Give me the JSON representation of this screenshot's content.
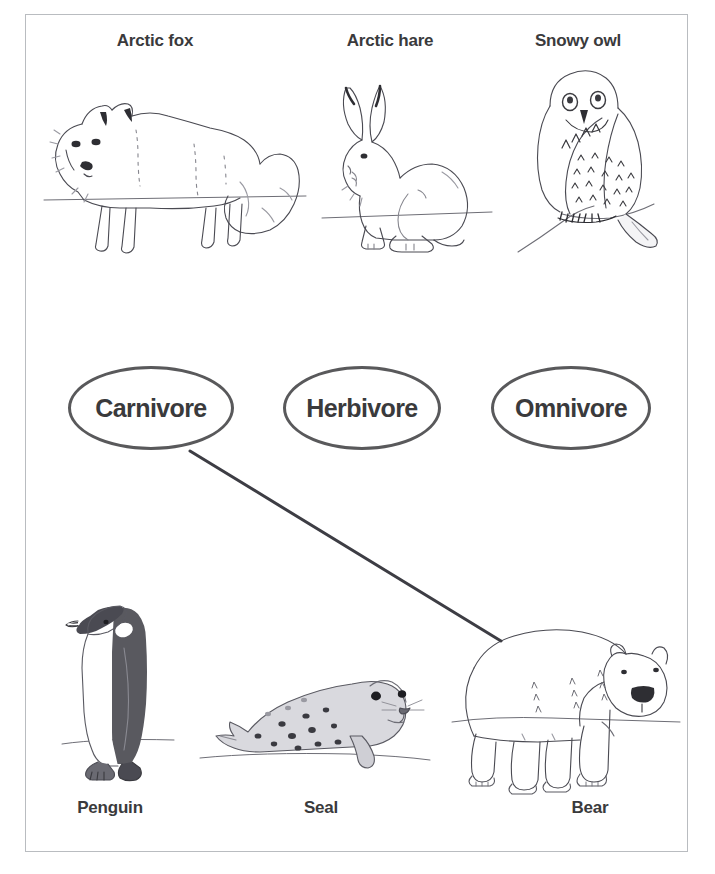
{
  "worksheet": {
    "title": "Arctic animals classification",
    "border_color": "#b9bcc0",
    "background_color": "#ffffff",
    "ink_color": "#3a3a3c",
    "oval_stroke_color": "#59595b",
    "connector_color": "#3d3d44"
  },
  "top_row": {
    "animals": [
      {
        "label": "Arctic fox",
        "icon": "arctic-fox-illustration",
        "center_x": 155,
        "label_y": 31
      },
      {
        "label": "Arctic hare",
        "icon": "arctic-hare-illustration",
        "center_x": 390,
        "label_y": 31
      },
      {
        "label": "Snowy owl",
        "icon": "snowy-owl-illustration",
        "center_x": 578,
        "label_y": 31
      }
    ]
  },
  "categories": {
    "ovals": [
      {
        "label": "Carnivore",
        "left": 68,
        "top": 366,
        "width": 166,
        "height": 84
      },
      {
        "label": "Herbivore",
        "left": 283,
        "top": 366,
        "width": 158,
        "height": 84
      },
      {
        "label": "Omnivore",
        "left": 491,
        "top": 366,
        "width": 160,
        "height": 84
      }
    ]
  },
  "bottom_row": {
    "animals": [
      {
        "label": "Penguin",
        "icon": "penguin-illustration",
        "center_x": 110,
        "label_y": 798
      },
      {
        "label": "Seal",
        "icon": "seal-illustration",
        "center_x": 321,
        "label_y": 798
      },
      {
        "label": "Bear",
        "icon": "bear-illustration",
        "center_x": 590,
        "label_y": 798
      }
    ]
  },
  "connections": [
    {
      "name": "carnivore-to-bear",
      "from": "Carnivore",
      "to": "Bear",
      "x1": 190,
      "y1": 451,
      "x2": 501,
      "y2": 641,
      "stroke_width": 3
    }
  ]
}
